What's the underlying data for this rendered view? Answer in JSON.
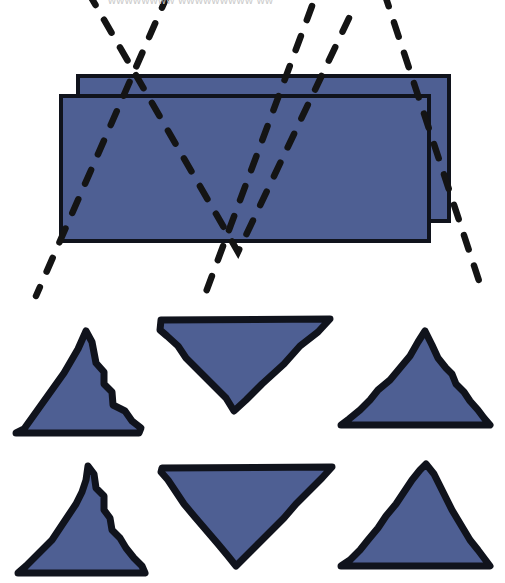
{
  "figure": {
    "title_fragment": "wwwwwwww wwwwwwwww ww",
    "background_color": "#ffffff",
    "fill_color": "#4e5f93",
    "outline_color": "#10131c",
    "dash_color": "#141414",
    "panels": [
      {
        "name": "rectangles-panel",
        "label": "overlapping rectangles with dashed zigzag overlay",
        "shapes": [
          {
            "name": "back-rectangle",
            "kind": "rectangle",
            "x": 78,
            "y": 76,
            "width": 371,
            "height": 145,
            "fill": "#4e5f93",
            "stroke": "#10131c",
            "stroke_width": 4
          },
          {
            "name": "front-rectangle",
            "kind": "rectangle",
            "x": 61,
            "y": 96,
            "width": 368,
            "height": 145,
            "fill": "#4e5f93",
            "stroke": "#10131c",
            "stroke_width": 4
          }
        ],
        "dashed_lines": [
          {
            "name": "dashed-v-left",
            "kind": "polyline",
            "points": "88,-8 238,252 350,16"
          },
          {
            "name": "dashed-v-right",
            "kind": "polyline",
            "points": "168,-6 36,296"
          },
          {
            "name": "dashed-down-right",
            "kind": "polyline",
            "points": "312,6 206,292"
          },
          {
            "name": "dashed-far-right",
            "kind": "polyline",
            "points": "384,-8 482,290"
          }
        ]
      },
      {
        "name": "triangles-panel",
        "label": "six rough triangles in two rows",
        "rows": [
          {
            "name": "triangle-row-top",
            "triangles": [
              {
                "name": "triangle-top-left-up",
                "orientation": "up",
                "points": "16,433 24,429 64,373 78,349 86,331 92,342 96,363 104,372 104,384 112,392 113,405 125,411 132,421 141,428 139,433"
              },
              {
                "name": "triangle-top-middle-down",
                "orientation": "down",
                "points": "161,320 330,319 318,332 300,346 284,364 262,384 246,400 234,411 226,398 214,386 200,372 186,358 178,346 167,336 160,330"
              },
              {
                "name": "triangle-top-right-up",
                "orientation": "up",
                "points": "341,425 349,419 360,410 370,400 378,390 390,380 400,368 410,356 418,342 425,331 432,345 438,358 446,368 452,374 456,384 464,392 470,401 478,410 484,418 490,425"
              }
            ]
          },
          {
            "name": "triangle-row-bottom",
            "triangles": [
              {
                "name": "triangle-bottom-left-up",
                "orientation": "up",
                "points": "18,573 26,566 40,552 52,540 60,528 68,516 76,504 82,492 86,480 88,466 94,474 96,488 104,496 104,510 110,518 112,530 120,538 126,548 134,558 142,566 145,573"
              },
              {
                "name": "triangle-bottom-middle-down",
                "orientation": "down",
                "points": "162,468 332,467 322,478 310,490 296,504 284,518 270,532 256,546 244,558 236,566 228,556 218,544 206,530 194,516 184,504 176,492 168,480 161,472"
              },
              {
                "name": "triangle-bottom-right-up",
                "orientation": "up",
                "points": "341,566 350,560 360,550 368,540 378,528 386,516 396,504 404,492 412,480 420,470 426,464 434,474 440,486 446,498 452,510 458,520 464,530 470,540 478,550 484,558 490,566"
              }
            ]
          }
        ]
      }
    ]
  }
}
